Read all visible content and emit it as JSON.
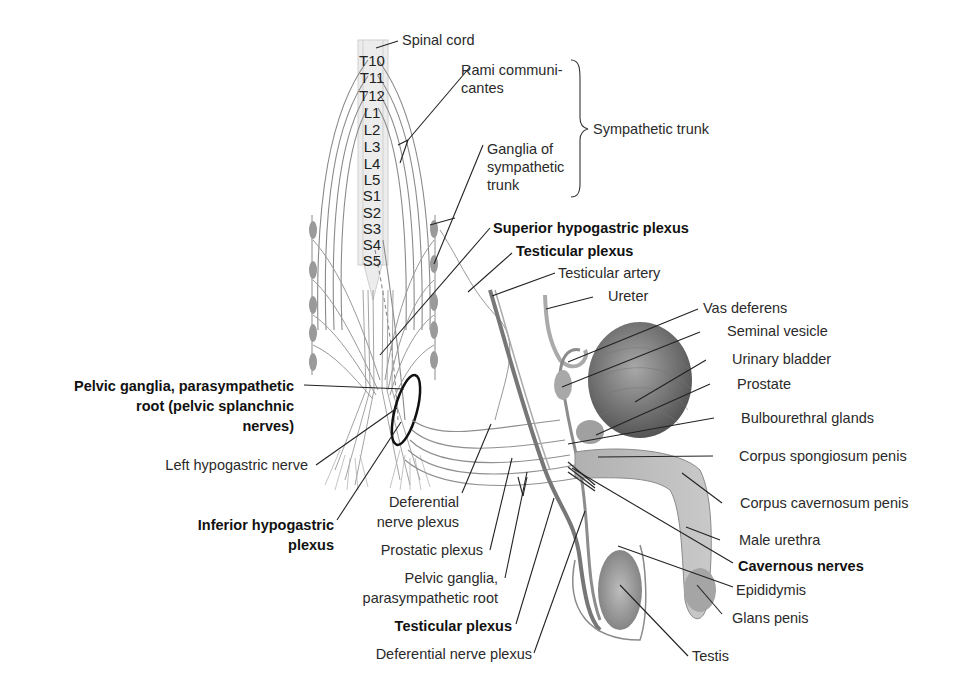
{
  "figure": {
    "spine_segments": [
      "T10",
      "T11",
      "T12",
      "L1",
      "L2",
      "L3",
      "L4",
      "L5",
      "S1",
      "S2",
      "S3",
      "S4",
      "S5"
    ],
    "labels": {
      "spinal_cord": "Spinal cord",
      "rami_1": "Rami communi-",
      "rami_2": "cantes",
      "ganglia_1": "Ganglia of",
      "ganglia_2": "sympathetic",
      "ganglia_3": "trunk",
      "sympathetic_trunk": "Sympathetic trunk",
      "superior_hypogastric": "Superior hypogastric plexus",
      "testicular_plexus_top": "Testicular plexus",
      "testicular_artery": "Testicular artery",
      "ureter": "Ureter",
      "vas_deferens": "Vas deferens",
      "seminal_vesicle": "Seminal vesicle",
      "urinary_bladder": "Urinary bladder",
      "prostate": "Prostate",
      "bulbourethral": "Bulbourethral glands",
      "corpus_spongiosum": "Corpus spongiosum penis",
      "corpus_cavernosum": "Corpus cavernosum penis",
      "male_urethra": "Male urethra",
      "cavernous_nerves": "Cavernous nerves",
      "epididymis": "Epididymis",
      "glans_penis": "Glans penis",
      "testis": "Testis",
      "pelvic_ganglia_root_1": "Pelvic ganglia, parasympathetic",
      "pelvic_ganglia_root_2": "root (pelvic splanchnic",
      "pelvic_ganglia_root_3": "nerves)",
      "left_hypogastric": "Left hypogastric nerve",
      "inferior_hypogastric_1": "Inferior hypogastric",
      "inferior_hypogastric_2": "plexus",
      "deferential_plexus_1": "Deferential",
      "deferential_plexus_2": "nerve plexus",
      "prostatic_plexus": "Prostatic plexus",
      "pelvic_ganglia_2_1": "Pelvic ganglia,",
      "pelvic_ganglia_2_2": "parasympathetic root",
      "testicular_plexus_bottom": "Testicular plexus",
      "deferential_nerve_plexus_bottom": "Deferential nerve plexus"
    },
    "colors": {
      "nerve": "#8a8a8a",
      "organ": "#9a9a9a",
      "leader": "#222222",
      "highlight_ellipse": "#111111"
    }
  }
}
